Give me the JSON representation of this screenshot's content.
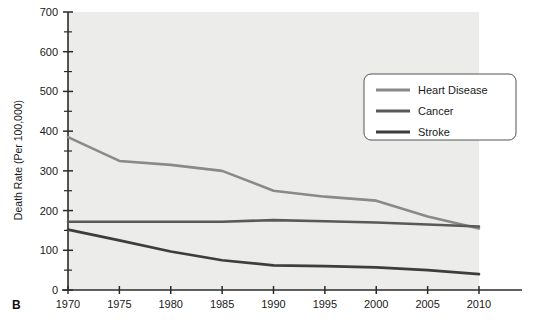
{
  "panel": {
    "label": "B"
  },
  "chart_data": {
    "type": "line",
    "title": "",
    "xlabel": "",
    "ylabel": "Death Rate (Per 100,000)",
    "x": [
      1970,
      1975,
      1980,
      1985,
      1990,
      1995,
      2000,
      2005,
      2010
    ],
    "xlim": [
      1970,
      2010
    ],
    "ylim": [
      0,
      700
    ],
    "ytick_step": 100,
    "yminor_step": 50,
    "xtick_step": 5,
    "grid": false,
    "legend_position": "upper-right",
    "xticklabels": [
      "1970",
      "1975",
      "1980",
      "1985",
      "1990",
      "1995",
      "2000",
      "2005",
      "2010"
    ],
    "yticklabels": [
      "0",
      "100",
      "200",
      "300",
      "400",
      "500",
      "600",
      "700"
    ],
    "series": [
      {
        "name": "Heart Disease",
        "color": "#8a8a8a",
        "values": [
          385,
          325,
          315,
          300,
          250,
          235,
          225,
          185,
          155
        ]
      },
      {
        "name": "Cancer",
        "color": "#595959",
        "values": [
          172,
          172,
          172,
          172,
          176,
          173,
          170,
          165,
          160
        ]
      },
      {
        "name": "Stroke",
        "color": "#3d3d3d",
        "values": [
          152,
          125,
          97,
          75,
          62,
          60,
          57,
          50,
          40
        ]
      }
    ]
  },
  "legend": {
    "items": [
      {
        "label": "Heart Disease",
        "color": "#8a8a8a"
      },
      {
        "label": "Cancer",
        "color": "#595959"
      },
      {
        "label": "Stroke",
        "color": "#3d3d3d"
      }
    ]
  }
}
